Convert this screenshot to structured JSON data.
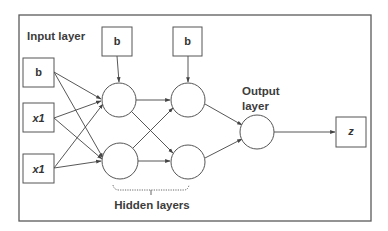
{
  "diagram": {
    "type": "neural-network",
    "labels": {
      "input_layer": "Input layer",
      "output_layer_line1": "Output",
      "output_layer_line2": "layer",
      "hidden_layers": "Hidden layers"
    },
    "input_nodes": [
      {
        "id": "in_b",
        "label": "b",
        "italic": false
      },
      {
        "id": "in_x1a",
        "label": "x1",
        "italic": true
      },
      {
        "id": "in_x1b",
        "label": "x1",
        "italic": true
      }
    ],
    "bias_nodes": [
      {
        "id": "bias_h1",
        "label": "b"
      },
      {
        "id": "bias_h2",
        "label": "b"
      }
    ],
    "hidden_layers": [
      {
        "id": "h1",
        "neurons": 2
      },
      {
        "id": "h2",
        "neurons": 2
      }
    ],
    "output_neuron": {
      "id": "out",
      "neurons": 1
    },
    "output_node": {
      "id": "z",
      "label": "z",
      "italic": true
    },
    "edges": [
      [
        "in_b",
        "h1_n1"
      ],
      [
        "in_b",
        "h1_n2"
      ],
      [
        "in_x1a",
        "h1_n1"
      ],
      [
        "in_x1a",
        "h1_n2"
      ],
      [
        "in_x1b",
        "h1_n1"
      ],
      [
        "in_x1b",
        "h1_n2"
      ],
      [
        "bias_h1",
        "h1_n1"
      ],
      [
        "bias_h2",
        "h2_n1"
      ],
      [
        "h1_n1",
        "h2_n1"
      ],
      [
        "h1_n1",
        "h2_n2"
      ],
      [
        "h1_n2",
        "h2_n1"
      ],
      [
        "h1_n2",
        "h2_n2"
      ],
      [
        "h2_n1",
        "out"
      ],
      [
        "h2_n2",
        "out"
      ],
      [
        "out",
        "z"
      ]
    ],
    "colors": {
      "stroke": "#555555",
      "text": "#3c3c3c",
      "background": "#ffffff"
    }
  }
}
